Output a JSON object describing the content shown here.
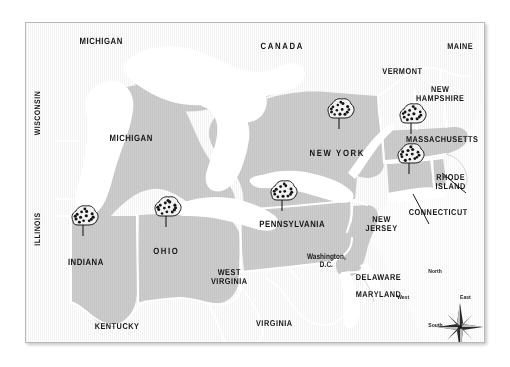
{
  "map": {
    "title": "Apple Producing States of the Northeastern and Midwestern United States",
    "frame": {
      "x": 25,
      "y": 22,
      "width": 460,
      "height": 321
    },
    "colors": {
      "page_background": "#ffffff",
      "land": "#e2e2e2",
      "highlighted_state": "#9b9b9b",
      "water": "#ffffff",
      "border": "#ffffff",
      "frame_border": "#b9b9b9",
      "label_text": "#161616"
    },
    "legend_note": "Shaded (darker gray) states are highlighted; tree symbols mark apple production."
  },
  "labels": [
    {
      "name": "michigan-upper",
      "text": "MICHIGAN",
      "x": 100,
      "y": 40,
      "size": 9,
      "rotated": false
    },
    {
      "name": "canada",
      "text": "CANADA",
      "x": 281,
      "y": 45,
      "size": 9,
      "rotated": false,
      "spaced": true
    },
    {
      "name": "maine",
      "text": "MAINE",
      "x": 459,
      "y": 45,
      "size": 8.5,
      "rotated": false
    },
    {
      "name": "vermont",
      "text": "VERMONT",
      "x": 401,
      "y": 70,
      "size": 8.5,
      "rotated": false
    },
    {
      "name": "new-hampshire",
      "text": "NEW\nHAMPSHIRE",
      "x": 439,
      "y": 92,
      "size": 8.5,
      "rotated": false
    },
    {
      "name": "wisconsin",
      "text": "WISCONSIN",
      "x": 37,
      "y": 112,
      "size": 8,
      "rotated": true
    },
    {
      "name": "michigan-lower",
      "text": "MICHIGAN",
      "x": 130,
      "y": 137,
      "size": 9,
      "rotated": false
    },
    {
      "name": "new-york",
      "text": "NEW YORK",
      "x": 336,
      "y": 152,
      "size": 9,
      "rotated": false,
      "spaced": true
    },
    {
      "name": "massachusetts",
      "text": "MASSACHUSETTS",
      "x": 441,
      "y": 138,
      "size": 8.5,
      "rotated": false
    },
    {
      "name": "rhode-island",
      "text": "RHODE\nISLAND",
      "x": 449,
      "y": 180,
      "size": 8.5,
      "rotated": false
    },
    {
      "name": "connecticut",
      "text": "CONNECTICUT",
      "x": 437,
      "y": 211,
      "size": 8.5,
      "rotated": false
    },
    {
      "name": "pennsylvania",
      "text": "PENNSYLVANIA",
      "x": 291,
      "y": 223,
      "size": 9,
      "rotated": false
    },
    {
      "name": "new-jersey",
      "text": "NEW\nJERSEY",
      "x": 380,
      "y": 222,
      "size": 8.5,
      "rotated": false
    },
    {
      "name": "illinois",
      "text": "ILLINOIS",
      "x": 37,
      "y": 228,
      "size": 8,
      "rotated": true
    },
    {
      "name": "indiana",
      "text": "INDIANA",
      "x": 85,
      "y": 261,
      "size": 9,
      "rotated": false
    },
    {
      "name": "ohio",
      "text": "OHIO",
      "x": 165,
      "y": 250,
      "size": 9,
      "rotated": false,
      "spaced": true
    },
    {
      "name": "west-virginia",
      "text": "WEST\nVIRGINIA",
      "x": 228,
      "y": 275,
      "size": 8.5,
      "rotated": false
    },
    {
      "name": "washington-dc",
      "text": "Washington,\nD.C.",
      "x": 325,
      "y": 260,
      "size": 8,
      "rotated": false,
      "mixed_case": true
    },
    {
      "name": "delaware",
      "text": "DELAWARE",
      "x": 377,
      "y": 276,
      "size": 8.5,
      "rotated": false
    },
    {
      "name": "maryland",
      "text": "MARYLAND",
      "x": 377,
      "y": 293,
      "size": 8.5,
      "rotated": false
    },
    {
      "name": "kentucky",
      "text": "KENTUCKY",
      "x": 116,
      "y": 325,
      "size": 8.5,
      "rotated": false
    },
    {
      "name": "virginia",
      "text": "VIRGINIA",
      "x": 273,
      "y": 322,
      "size": 8.5,
      "rotated": false
    }
  ],
  "highlighted_states": [
    "MICHIGAN",
    "INDIANA",
    "OHIO",
    "PENNSYLVANIA",
    "NEW YORK",
    "MASSACHUSETTS",
    "CONNECTICUT",
    "NEW JERSEY",
    "RHODE ISLAND"
  ],
  "tree_markers": [
    {
      "name": "tree-marker-indiana",
      "state": "INDIANA",
      "x": 82,
      "y": 222
    },
    {
      "name": "tree-marker-ohio",
      "state": "OHIO",
      "x": 165,
      "y": 213
    },
    {
      "name": "tree-marker-pennsylvania",
      "state": "PENNSYLVANIA",
      "x": 281,
      "y": 197
    },
    {
      "name": "tree-marker-new-york",
      "state": "NEW YORK",
      "x": 338,
      "y": 115
    },
    {
      "name": "tree-marker-massachusetts",
      "state": "MASSACHUSETTS",
      "x": 410,
      "y": 120
    },
    {
      "name": "tree-marker-connecticut",
      "state": "CONNECTICUT",
      "x": 408,
      "y": 160
    }
  ],
  "leader_lines": [
    {
      "name": "leader-line-rhode-island",
      "from_label": "RHODE ISLAND",
      "x1": 441,
      "y1": 172,
      "x2": 417,
      "y2": 152
    },
    {
      "name": "leader-line-connecticut",
      "from_label": "CONNECTICUT",
      "x1": 404,
      "y1": 203,
      "x2": 388,
      "y2": 173
    }
  ],
  "compass": {
    "name": "compass-rose",
    "center_x": 434,
    "center_y": 300,
    "north": "North",
    "south": "South",
    "east": "East",
    "west": "West"
  }
}
